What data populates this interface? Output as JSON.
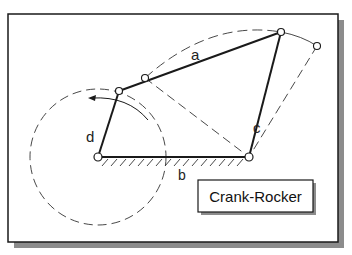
{
  "figure": {
    "title": "Crank-Rocker",
    "mechanism": "four-bar linkage",
    "link_labels": {
      "crank": "d",
      "coupler": "a",
      "rocker": "c",
      "ground": "b"
    },
    "colors": {
      "line": "#1a1a1a",
      "dashed": "#333333",
      "frame": "#1a1a1a",
      "shadow": "#8c8c8c",
      "background": "#ffffff"
    }
  }
}
